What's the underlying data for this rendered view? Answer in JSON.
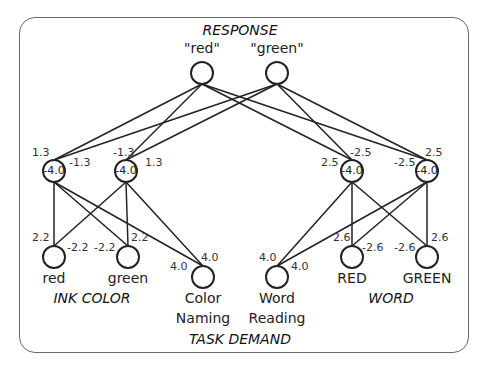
{
  "groups": {
    "response": "RESPONSE",
    "ink_color": "INK COLOR",
    "word": "WORD",
    "task_demand": "TASK DEMAND"
  },
  "nodes": {
    "resp_red": {
      "label": "\"red\"",
      "x": 202,
      "y": 73
    },
    "resp_green": {
      "label": "\"green\"",
      "x": 277,
      "y": 73
    },
    "h1": {
      "bias": "-4.0",
      "x": 54,
      "y": 171
    },
    "h2": {
      "bias": "-4.0",
      "x": 126,
      "y": 171
    },
    "h3": {
      "bias": "-4.0",
      "x": 352,
      "y": 171
    },
    "h4": {
      "bias": "-4.0",
      "x": 427,
      "y": 171
    },
    "in_red": {
      "label": "red",
      "x": 54,
      "y": 257
    },
    "in_green": {
      "label": "green",
      "x": 128,
      "y": 257
    },
    "task_color": {
      "label1": "Color",
      "label2": "Naming",
      "x": 203,
      "y": 277
    },
    "task_word": {
      "label1": "Word",
      "label2": "Reading",
      "x": 277,
      "y": 277
    },
    "word_red": {
      "label": "RED",
      "x": 352,
      "y": 257
    },
    "word_green": {
      "label": "GREEN",
      "x": 427,
      "y": 257
    }
  },
  "weights": {
    "h1_top_left": "1.3",
    "h1_top_right": "-1.3",
    "h2_top_left": "-1.3",
    "h2_top_right": "1.3",
    "h3_top_left": "2.5",
    "h3_top_right": "-2.5",
    "h4_top_left": "-2.5",
    "h4_top_right": "2.5",
    "in_red_left": "2.2",
    "in_red_right": "-2.2",
    "in_green_left": "-2.2",
    "in_green_right": "2.2",
    "task_color_left": "4.0",
    "task_color_right": "4.0",
    "task_word_left": "4.0",
    "task_word_right": "4.0",
    "word_red_left": "2.6",
    "word_red_right": "-2.6",
    "word_green_left": "-2.6",
    "word_green_right": "2.6"
  },
  "colors": {
    "line": "#222222",
    "frame": "#6a6a6a"
  }
}
